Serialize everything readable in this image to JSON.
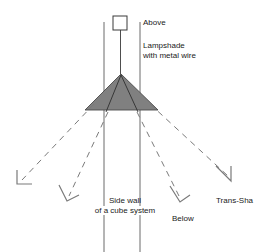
{
  "diagram": {
    "colors": {
      "line": "#3a3a3a",
      "dashed_ray": "#7a7a7a",
      "shade_fill": "#808080",
      "shade_stroke": "#5a5a5a",
      "text": "#1a1a1a",
      "background": "#ffffff"
    },
    "labels": {
      "above": "Above",
      "lampshade_line1": "Lampshade",
      "lampshade_line2": "with metal wire",
      "sidewall_line1": "Side wall",
      "sidewall_line2": "of a cube system",
      "below": "Below",
      "trans_sha": "Trans-Sha"
    },
    "shapes": {
      "ceiling_box": {
        "x": 113,
        "y": 16,
        "width": 14,
        "height": 14
      },
      "suspension_wire": {
        "x": 120,
        "y1": 30,
        "y2": 74
      },
      "wall_left_x": 104,
      "wall_right_x": 140,
      "wall_y_top": 22,
      "wall_y_bottom": 252,
      "shade_apex": {
        "x": 121,
        "y": 74
      },
      "shade_base_left": {
        "x": 85,
        "y": 110
      },
      "shade_base_right": {
        "x": 158,
        "y": 110
      }
    },
    "rays": [
      {
        "name": "ray-far-left",
        "x1": 94,
        "y1": 104,
        "x2": 20,
        "y2": 182
      },
      {
        "name": "ray-mid-left",
        "x1": 108,
        "y1": 110,
        "x2": 68,
        "y2": 198
      },
      {
        "name": "ray-mid-right",
        "x1": 137,
        "y1": 110,
        "x2": 180,
        "y2": 198
      },
      {
        "name": "ray-far-right",
        "x1": 150,
        "y1": 104,
        "x2": 229,
        "y2": 178
      }
    ],
    "arrowheads": [
      {
        "name": "arrowhead-far-left",
        "x": 20,
        "y": 182
      },
      {
        "name": "arrowhead-mid-left",
        "x": 68,
        "y": 198
      },
      {
        "name": "arrowhead-mid-right",
        "x": 180,
        "y": 198
      },
      {
        "name": "arrowhead-far-right",
        "x": 229,
        "y": 178
      }
    ]
  }
}
